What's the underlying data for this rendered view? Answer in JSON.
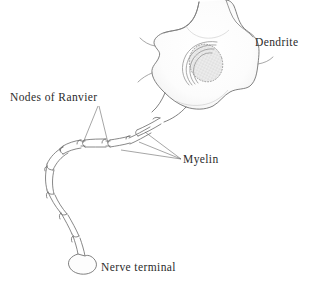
{
  "figure": {
    "style": "hand-drawn line illustration",
    "background_color": "#ffffff",
    "ink_color": "#555555",
    "text_color": "#2b2b2b",
    "nucleus_fill": "#ebebeb",
    "soma_fill": "#fbfbfb"
  },
  "labels": {
    "dendrite": "Dendrite",
    "nodes_of_ranvier": "Nodes of Ranvier",
    "myelin": "Myelin",
    "nerve_terminal": "Nerve terminal"
  },
  "parts": {
    "soma": "cell-body",
    "nucleus": "nucleus",
    "golgi": "golgi-apparatus",
    "axon": "axon",
    "myelin_segments": 9,
    "node_gaps": 8,
    "terminal_bulb": "synaptic-bouton"
  },
  "leader_lines": {
    "nodes_of_ranvier": 2,
    "myelin": 3,
    "dendrite": 0,
    "nerve_terminal": 0
  }
}
